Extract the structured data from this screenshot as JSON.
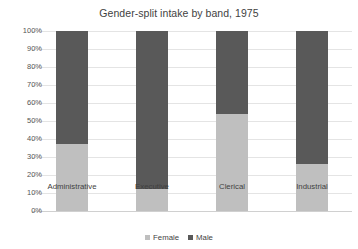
{
  "chart_data": {
    "type": "bar",
    "subtype": "stacked-100-percent",
    "title": "Gender-split intake by band, 1975",
    "xlabel": "",
    "ylabel": "",
    "categories": [
      "Administrative",
      "Executive",
      "Clerical",
      "Industrial"
    ],
    "series": [
      {
        "name": "Female",
        "color": "#bfbfbf",
        "values": [
          37,
          12,
          54,
          26
        ]
      },
      {
        "name": "Male",
        "color": "#595959",
        "values": [
          63,
          88,
          46,
          74
        ]
      }
    ],
    "ylim": [
      0,
      100
    ],
    "ytick_labels": [
      "100%",
      "90%",
      "80%",
      "70%",
      "60%",
      "50%",
      "40%",
      "30%",
      "20%",
      "10%",
      "0%"
    ],
    "ytick_values": [
      100,
      90,
      80,
      70,
      60,
      50,
      40,
      30,
      20,
      10,
      0
    ],
    "grid": true,
    "grid_axis": "y",
    "legend_position": "bottom",
    "legend_entries": [
      "Female",
      "Male"
    ],
    "value_suffix": "%"
  },
  "style": {
    "background": "#ffffff",
    "grid_color": "#e4e4e4",
    "baseline_color": "#d0d0d0",
    "title_color": "#3f3f3f",
    "tick_color": "#555555",
    "label_color": "#3f3f3f"
  }
}
